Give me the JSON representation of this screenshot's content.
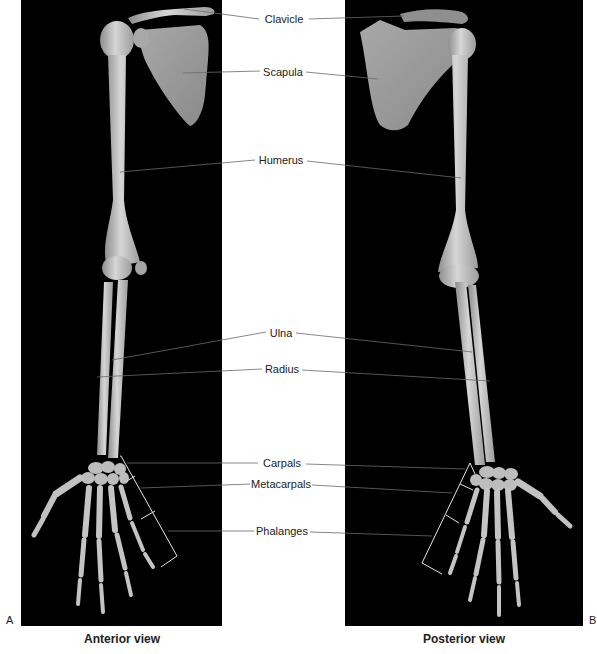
{
  "figure": {
    "panels": [
      {
        "id": "A",
        "letter": "A",
        "caption": "Anterior view"
      },
      {
        "id": "B",
        "letter": "B",
        "caption": "Posterior view"
      }
    ],
    "labels": [
      {
        "key": "clavicle",
        "text": "Clavicle",
        "x": 284,
        "y": 19
      },
      {
        "key": "scapula",
        "text": "Scapula",
        "x": 283,
        "y": 72
      },
      {
        "key": "humerus",
        "text": "Humerus",
        "x": 281,
        "y": 160
      },
      {
        "key": "ulna",
        "text": "Ulna",
        "x": 281,
        "y": 333
      },
      {
        "key": "radius",
        "text": "Radius",
        "x": 282,
        "y": 369
      },
      {
        "key": "carpals",
        "text": "Carpals",
        "x": 282,
        "y": 463
      },
      {
        "key": "metacarpals",
        "text": "Metacarpals",
        "x": 281,
        "y": 484
      },
      {
        "key": "phalanges",
        "text": "Phalanges",
        "x": 282,
        "y": 531
      }
    ],
    "colors": {
      "panel_bg": "#000000",
      "bone": "#c9c9c9",
      "bone_shade": "#9a9a9a",
      "leader_line": "#555555",
      "leader_line_on_dark": "#d8d8d8",
      "page_bg": "#ffffff",
      "text": "#222222"
    }
  }
}
